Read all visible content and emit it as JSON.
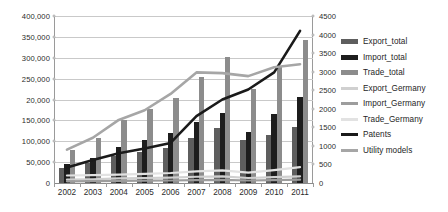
{
  "chart_data": {
    "type": "bar",
    "title": "",
    "subtitle": "",
    "xlabel": "",
    "ylabel": "",
    "grid": true,
    "legend_position": "right",
    "categories": [
      "2002",
      "2003",
      "2004",
      "2005",
      "2006",
      "2007",
      "2008",
      "2009",
      "2010",
      "2011"
    ],
    "axes": {
      "left": {
        "label": "",
        "min": 0,
        "max": 400000,
        "step": 50000,
        "ticks": [
          0,
          50000,
          100000,
          150000,
          200000,
          250000,
          300000,
          350000,
          400000
        ],
        "tick_labels": [
          "0",
          "50,000",
          "100,000",
          "150,000",
          "20,000",
          "250,000",
          "300,000",
          "350,000",
          "400,000"
        ],
        "applies_to": [
          "Export_total",
          "Import_total",
          "Trade_total",
          "Export_Germany",
          "Import_Germany",
          "Trade_Germany"
        ]
      },
      "right": {
        "label": "",
        "min": 0,
        "max": 4500,
        "step": 500,
        "ticks": [
          0,
          500,
          1000,
          1500,
          2000,
          2500,
          3000,
          3500,
          4000,
          4500
        ],
        "tick_labels": [
          "0",
          "500",
          "1000",
          "1500",
          "2000",
          "2500",
          "3000",
          "3500",
          "4000",
          "4500"
        ],
        "applies_to": [
          "Patents",
          "Utility models"
        ]
      }
    },
    "series": [
      {
        "name": "Export_total",
        "kind": "bar",
        "axis": "left",
        "color": "#5e5e5e",
        "values": [
          35000,
          47000,
          65000,
          75000,
          85000,
          107000,
          131000,
          102000,
          114000,
          135000
        ]
      },
      {
        "name": "Import_total",
        "kind": "bar",
        "axis": "left",
        "color": "#1d1d1d",
        "values": [
          45000,
          60000,
          87000,
          102000,
          119000,
          146000,
          168000,
          122000,
          165000,
          207000
        ]
      },
      {
        "name": "Trade_total",
        "kind": "bar",
        "axis": "left",
        "color": "#8c8c8c",
        "values": [
          80000,
          107000,
          152000,
          177000,
          204000,
          254000,
          301000,
          224000,
          278000,
          343000
        ]
      },
      {
        "name": "Export_Germany",
        "kind": "line",
        "axis": "left",
        "color": "#d0d0d0",
        "values": [
          8000,
          9000,
          11000,
          12000,
          13000,
          15000,
          16000,
          12000,
          14000,
          16000
        ]
      },
      {
        "name": "Import_Germany",
        "kind": "line",
        "axis": "left",
        "color": "#9d9d9d",
        "values": [
          4000,
          4500,
          5000,
          5500,
          6000,
          7000,
          7500,
          6000,
          7000,
          8000
        ]
      },
      {
        "name": "Trade_Germany",
        "kind": "line",
        "axis": "left",
        "color": "#e2e2e2",
        "values": [
          18000,
          19000,
          20000,
          22000,
          24000,
          28000,
          30000,
          25000,
          31000,
          38000
        ]
      },
      {
        "name": "Patents",
        "kind": "line",
        "axis": "right",
        "color": "#1a1a1a",
        "values": [
          420,
          620,
          800,
          930,
          1080,
          1800,
          2250,
          2520,
          2980,
          4100
        ]
      },
      {
        "name": "Utility models",
        "kind": "line",
        "axis": "right",
        "color": "#a6a6a6",
        "values": [
          900,
          1220,
          1700,
          1960,
          2400,
          2980,
          2960,
          2880,
          3120,
          3200
        ]
      }
    ]
  },
  "legend": {
    "items": [
      {
        "label": "Export_total",
        "swatch": "bar",
        "color": "#5e5e5e"
      },
      {
        "label": "Import_total",
        "swatch": "bar",
        "color": "#1d1d1d"
      },
      {
        "label": "Trade_total",
        "swatch": "bar",
        "color": "#8c8c8c"
      },
      {
        "label": "Export_Germany",
        "swatch": "line",
        "color": "#d0d0d0"
      },
      {
        "label": "Import_Germany",
        "swatch": "line",
        "color": "#9d9d9d"
      },
      {
        "label": "Trade_Germany",
        "swatch": "line",
        "color": "#e2e2e2"
      },
      {
        "label": "Patents",
        "swatch": "line",
        "color": "#1a1a1a"
      },
      {
        "label": "Utility models",
        "swatch": "line",
        "color": "#a6a6a6"
      }
    ]
  }
}
